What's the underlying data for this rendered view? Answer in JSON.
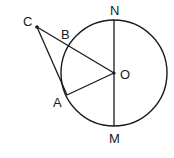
{
  "diagram": {
    "type": "geometry",
    "stroke_color": "#1a1a1a",
    "background": "#ffffff",
    "circle": {
      "center": "O",
      "cx": 114,
      "cy": 73,
      "r": 53
    },
    "points": {
      "C": {
        "label": "C",
        "x": 37,
        "y": 27,
        "label_x": 23,
        "label_y": 26
      },
      "B": {
        "label": "B",
        "x": 69,
        "y": 46,
        "label_x": 61,
        "label_y": 39
      },
      "O": {
        "label": "O",
        "x": 114,
        "y": 73,
        "label_x": 120,
        "label_y": 79
      },
      "A": {
        "label": "A",
        "x": 67,
        "y": 95,
        "label_x": 53,
        "label_y": 107
      },
      "N": {
        "label": "N",
        "x": 114,
        "y": 20,
        "label_x": 110,
        "label_y": 15
      },
      "M": {
        "label": "M",
        "x": 114,
        "y": 126,
        "label_x": 109,
        "label_y": 143
      }
    },
    "segments": [
      {
        "from": "C",
        "to": "O"
      },
      {
        "from": "C",
        "to": "A"
      },
      {
        "from": "A",
        "to": "O"
      },
      {
        "from": "N",
        "to": "M"
      }
    ]
  }
}
